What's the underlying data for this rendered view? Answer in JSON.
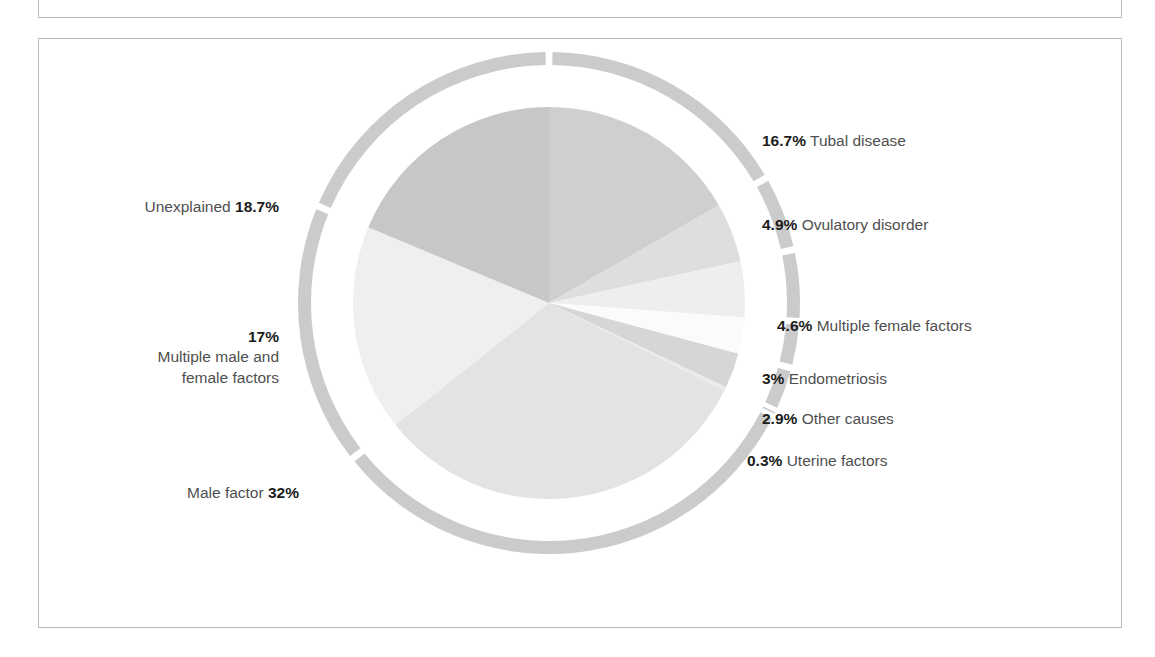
{
  "title": "FACTORS RESPONSIBLE FOR INFERTILITY",
  "chart_data": {
    "type": "pie",
    "title": "FACTORS RESPONSIBLE FOR INFERTILITY",
    "xlabel": "",
    "ylabel": "",
    "legend_position": "callout-labels",
    "grid": false,
    "start_angle_deg": 0,
    "direction": "clockwise",
    "units": "percent",
    "total": 100.1,
    "categories": [
      "Tubal disease",
      "Ovulatory disorder",
      "Multiple female factors",
      "Endometriosis",
      "Other causes",
      "Uterine factors",
      "Male factor",
      "Multiple male and female factors",
      "Unexplained"
    ],
    "values": [
      16.7,
      4.9,
      4.6,
      3,
      2.9,
      0.3,
      32,
      17,
      18.7
    ],
    "colors": [
      "#cfcfcf",
      "#dedede",
      "#eeeeee",
      "#fbfbfb",
      "#d6d6d6",
      "#eaeaea",
      "#e3e3e3",
      "#efefef",
      "#c7c7c7"
    ],
    "ring_color": "#cbcbcb",
    "slices": [
      {
        "label": "Tubal disease",
        "value": 16.7,
        "value_text": "16.7%",
        "color": "#cfcfcf"
      },
      {
        "label": "Ovulatory disorder",
        "value": 4.9,
        "value_text": "4.9%",
        "color": "#dedede"
      },
      {
        "label": "Multiple female factors",
        "value": 4.6,
        "value_text": "4.6%",
        "color": "#eeeeee"
      },
      {
        "label": "Endometriosis",
        "value": 3,
        "value_text": "3%",
        "color": "#fbfbfb"
      },
      {
        "label": "Other causes",
        "value": 2.9,
        "value_text": "2.9%",
        "color": "#d6d6d6"
      },
      {
        "label": "Uterine factors",
        "value": 0.3,
        "value_text": "0.3%",
        "color": "#eaeaea"
      },
      {
        "label": "Male factor",
        "value": 32,
        "value_text": "32%",
        "color": "#e3e3e3"
      },
      {
        "label": "Multiple male and female factors",
        "value": 17,
        "value_text": "17%",
        "color": "#efefef"
      },
      {
        "label": "Unexplained",
        "value": 18.7,
        "value_text": "18.7%",
        "color": "#c7c7c7"
      }
    ]
  },
  "labels": {
    "tubal": {
      "pct": "16.7%",
      "text": "Tubal disease"
    },
    "ovulatory": {
      "pct": "4.9%",
      "text": "Ovulatory disorder"
    },
    "multifemale": {
      "pct": "4.6%",
      "text": "Multiple female factors"
    },
    "endometrio": {
      "pct": "3%",
      "text": "Endometriosis"
    },
    "other": {
      "pct": "2.9%",
      "text": "Other causes"
    },
    "uterine": {
      "pct": "0.3%",
      "text": "Uterine factors"
    },
    "unexplained": {
      "pct": "18.7%",
      "text": "Unexplained"
    },
    "multiboth": {
      "pct": "17%",
      "line1": "Multiple male and",
      "line2": "female factors"
    },
    "male": {
      "pct": "32%",
      "text": "Male factor"
    }
  }
}
